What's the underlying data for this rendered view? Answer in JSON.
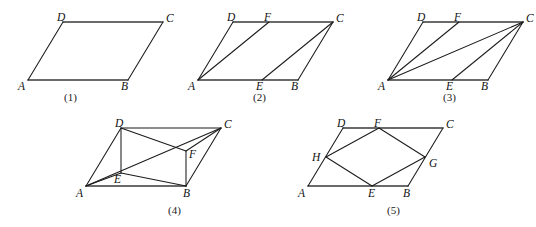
{
  "document": {
    "kind": "geometry-figure-sheet",
    "background_color": "#ffffff",
    "line_color": "#1b1b1b",
    "text_color": "#111111",
    "width": 536,
    "height": 227
  },
  "figures": [
    {
      "id": "fig1",
      "caption": "(1)",
      "caption_pos": {
        "x": 64,
        "y": 92
      },
      "origin": {
        "x": 20,
        "y": 8
      },
      "points": {
        "A": {
          "x": 8,
          "y": 72
        },
        "B": {
          "x": 108,
          "y": 72
        },
        "C": {
          "x": 143,
          "y": 14
        },
        "D": {
          "x": 43,
          "y": 14
        }
      },
      "labels": [
        {
          "text": "A",
          "name": "vertex-label-a",
          "x": -2,
          "y": 73
        },
        {
          "text": "B",
          "name": "vertex-label-b",
          "x": 101,
          "y": 73
        },
        {
          "text": "C",
          "name": "vertex-label-c",
          "x": 146,
          "y": 5
        },
        {
          "text": "D",
          "name": "vertex-label-d",
          "x": 37,
          "y": 4
        }
      ],
      "segments": [
        {
          "name": "edge-ab",
          "from": "A",
          "to": "B",
          "style": "base"
        },
        {
          "name": "edge-bc",
          "from": "B",
          "to": "C",
          "style": "thin"
        },
        {
          "name": "edge-cd",
          "from": "C",
          "to": "D",
          "style": "base"
        },
        {
          "name": "edge-da",
          "from": "D",
          "to": "A",
          "style": "thin"
        }
      ]
    },
    {
      "id": "fig2",
      "caption": "(2)",
      "caption_pos": {
        "x": 253,
        "y": 92
      },
      "origin": {
        "x": 190,
        "y": 8
      },
      "points": {
        "A": {
          "x": 8,
          "y": 72
        },
        "B": {
          "x": 108,
          "y": 72
        },
        "C": {
          "x": 143,
          "y": 14
        },
        "D": {
          "x": 43,
          "y": 14
        },
        "E": {
          "x": 72,
          "y": 72
        },
        "F": {
          "x": 79,
          "y": 14
        }
      },
      "labels": [
        {
          "text": "A",
          "name": "vertex-label-a",
          "x": -2,
          "y": 73
        },
        {
          "text": "B",
          "name": "vertex-label-b",
          "x": 101,
          "y": 73
        },
        {
          "text": "C",
          "name": "vertex-label-c",
          "x": 146,
          "y": 5
        },
        {
          "text": "D",
          "name": "vertex-label-d",
          "x": 37,
          "y": 4
        },
        {
          "text": "E",
          "name": "vertex-label-e",
          "x": 66,
          "y": 73
        },
        {
          "text": "F",
          "name": "vertex-label-f",
          "x": 74,
          "y": 4
        }
      ],
      "segments": [
        {
          "name": "edge-ab",
          "from": "A",
          "to": "B",
          "style": "base"
        },
        {
          "name": "edge-bc",
          "from": "B",
          "to": "C",
          "style": "thin"
        },
        {
          "name": "edge-cd",
          "from": "C",
          "to": "D",
          "style": "base"
        },
        {
          "name": "edge-da",
          "from": "D",
          "to": "A",
          "style": "thin"
        },
        {
          "name": "segment-af",
          "from": "A",
          "to": "F",
          "style": "thin"
        },
        {
          "name": "segment-ec",
          "from": "E",
          "to": "C",
          "style": "thin"
        }
      ]
    },
    {
      "id": "fig3",
      "caption": "(3)",
      "caption_pos": {
        "x": 443,
        "y": 92
      },
      "origin": {
        "x": 380,
        "y": 8
      },
      "points": {
        "A": {
          "x": 8,
          "y": 72
        },
        "B": {
          "x": 108,
          "y": 72
        },
        "C": {
          "x": 143,
          "y": 14
        },
        "D": {
          "x": 43,
          "y": 14
        },
        "E": {
          "x": 72,
          "y": 72
        },
        "F": {
          "x": 79,
          "y": 14
        }
      },
      "labels": [
        {
          "text": "A",
          "name": "vertex-label-a",
          "x": -2,
          "y": 73
        },
        {
          "text": "B",
          "name": "vertex-label-b",
          "x": 101,
          "y": 73
        },
        {
          "text": "C",
          "name": "vertex-label-c",
          "x": 146,
          "y": 5
        },
        {
          "text": "D",
          "name": "vertex-label-d",
          "x": 37,
          "y": 4
        },
        {
          "text": "E",
          "name": "vertex-label-e",
          "x": 66,
          "y": 73
        },
        {
          "text": "F",
          "name": "vertex-label-f",
          "x": 74,
          "y": 4
        }
      ],
      "segments": [
        {
          "name": "edge-ab",
          "from": "A",
          "to": "B",
          "style": "base"
        },
        {
          "name": "edge-bc",
          "from": "B",
          "to": "C",
          "style": "thin"
        },
        {
          "name": "edge-cd",
          "from": "C",
          "to": "D",
          "style": "base"
        },
        {
          "name": "edge-da",
          "from": "D",
          "to": "A",
          "style": "thin"
        },
        {
          "name": "segment-af",
          "from": "A",
          "to": "F",
          "style": "thin"
        },
        {
          "name": "diagonal-ac",
          "from": "A",
          "to": "C",
          "style": "thin"
        },
        {
          "name": "segment-ec",
          "from": "E",
          "to": "C",
          "style": "thin"
        }
      ]
    },
    {
      "id": "fig4",
      "caption": "(4)",
      "caption_pos": {
        "x": 168,
        "y": 205
      },
      "origin": {
        "x": 78,
        "y": 118
      },
      "points": {
        "A": {
          "x": 8,
          "y": 68
        },
        "B": {
          "x": 108,
          "y": 68
        },
        "C": {
          "x": 143,
          "y": 10
        },
        "D": {
          "x": 43,
          "y": 10
        },
        "E": {
          "x": 43,
          "y": 55
        },
        "F": {
          "x": 108,
          "y": 33
        }
      },
      "labels": [
        {
          "text": "A",
          "name": "vertex-label-a",
          "x": -2,
          "y": 70
        },
        {
          "text": "B",
          "name": "vertex-label-b",
          "x": 105,
          "y": 70
        },
        {
          "text": "C",
          "name": "vertex-label-c",
          "x": 146,
          "y": 1
        },
        {
          "text": "D",
          "name": "vertex-label-d",
          "x": 37,
          "y": 0
        },
        {
          "text": "E",
          "name": "vertex-label-e",
          "x": 36,
          "y": 56
        },
        {
          "text": "F",
          "name": "vertex-label-f",
          "x": 111,
          "y": 31
        }
      ],
      "segments": [
        {
          "name": "edge-ab",
          "from": "A",
          "to": "B",
          "style": "base"
        },
        {
          "name": "edge-bc",
          "from": "B",
          "to": "C",
          "style": "thin"
        },
        {
          "name": "edge-cd",
          "from": "C",
          "to": "D",
          "style": "thin"
        },
        {
          "name": "edge-da",
          "from": "D",
          "to": "A",
          "style": "thin"
        },
        {
          "name": "segment-de",
          "from": "D",
          "to": "E",
          "style": "thin"
        },
        {
          "name": "segment-ae",
          "from": "A",
          "to": "E",
          "style": "thin"
        },
        {
          "name": "segment-eb",
          "from": "E",
          "to": "B",
          "style": "thin"
        },
        {
          "name": "diagonal-ac",
          "from": "A",
          "to": "C",
          "style": "thin"
        },
        {
          "name": "segment-df",
          "from": "D",
          "to": "F",
          "style": "thin"
        },
        {
          "name": "segment-fb",
          "from": "F",
          "to": "B",
          "style": "thin"
        },
        {
          "name": "segment-fc",
          "from": "F",
          "to": "C",
          "style": "thin"
        }
      ]
    },
    {
      "id": "fig5",
      "caption": "(5)",
      "caption_pos": {
        "x": 387,
        "y": 205
      },
      "origin": {
        "x": 300,
        "y": 118
      },
      "points": {
        "A": {
          "x": 8,
          "y": 68
        },
        "B": {
          "x": 108,
          "y": 68
        },
        "C": {
          "x": 143,
          "y": 10
        },
        "D": {
          "x": 43,
          "y": 10
        },
        "E": {
          "x": 72,
          "y": 68
        },
        "F": {
          "x": 79,
          "y": 10
        },
        "G": {
          "x": 125,
          "y": 39
        },
        "H": {
          "x": 26,
          "y": 39
        }
      },
      "labels": [
        {
          "text": "A",
          "name": "vertex-label-a",
          "x": -2,
          "y": 70
        },
        {
          "text": "B",
          "name": "vertex-label-b",
          "x": 103,
          "y": 70
        },
        {
          "text": "C",
          "name": "vertex-label-c",
          "x": 146,
          "y": 1
        },
        {
          "text": "D",
          "name": "vertex-label-d",
          "x": 37,
          "y": 0
        },
        {
          "text": "E",
          "name": "vertex-label-e",
          "x": 68,
          "y": 70
        },
        {
          "text": "F",
          "name": "vertex-label-f",
          "x": 74,
          "y": 0
        },
        {
          "text": "G",
          "name": "vertex-label-g",
          "x": 129,
          "y": 40
        },
        {
          "text": "H",
          "name": "vertex-label-h",
          "x": 12,
          "y": 34
        }
      ],
      "segments": [
        {
          "name": "edge-ab",
          "from": "A",
          "to": "B",
          "style": "base"
        },
        {
          "name": "edge-bc",
          "from": "B",
          "to": "C",
          "style": "thin"
        },
        {
          "name": "edge-cd",
          "from": "C",
          "to": "D",
          "style": "base"
        },
        {
          "name": "edge-da",
          "from": "D",
          "to": "A",
          "style": "thin"
        },
        {
          "name": "segment-hf",
          "from": "H",
          "to": "F",
          "style": "thin"
        },
        {
          "name": "segment-fg",
          "from": "F",
          "to": "G",
          "style": "thin"
        },
        {
          "name": "segment-ge",
          "from": "G",
          "to": "E",
          "style": "thin"
        },
        {
          "name": "segment-eh",
          "from": "E",
          "to": "H",
          "style": "thin"
        }
      ]
    }
  ]
}
